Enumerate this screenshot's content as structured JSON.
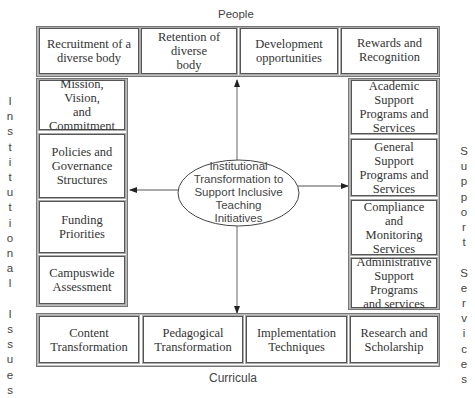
{
  "diagram": {
    "center": {
      "text": "Institutional\nTransformation to\nSupport Inclusive\nTeaching\nInitiatives"
    },
    "top_label": "People",
    "bottom_label": "Curricula",
    "left_label": "I\nn\ns\nt\ni\nt\nu\nt\ni\no\nn\na\nl\n\nI\ns\ns\nu\ne\ns",
    "right_label": "S\nu\np\np\no\nr\nt\n\nS\ne\nr\nv\ni\nc\ne\ns",
    "top_boxes": [
      {
        "text": "Recruitment of a\ndiverse body"
      },
      {
        "text": "Retention of diverse\nbody"
      },
      {
        "text": "Development\nopportunities"
      },
      {
        "text": "Rewards and\nRecognition"
      }
    ],
    "left_boxes": [
      {
        "text": "Mission, Vision,\nand Commitment"
      },
      {
        "text": "Policies and\nGovernance\nStructures"
      },
      {
        "text": "Funding\nPriorities"
      },
      {
        "text": "Campuswide\nAssessment"
      }
    ],
    "right_boxes": [
      {
        "text": "Academic Support\nPrograms and\nServices"
      },
      {
        "text": "General Support\nPrograms and\nServices"
      },
      {
        "text": "Compliance and\nMonitoring\nServices"
      },
      {
        "text": "Administrative\nSupport Programs\nand services"
      }
    ],
    "bottom_boxes": [
      {
        "text": "Content\nTransformation"
      },
      {
        "text": "Pedagogical\nTransformation"
      },
      {
        "text": "Implementation\nTechniques"
      },
      {
        "text": "Research and\nScholarship"
      }
    ],
    "colors": {
      "line": "#555555",
      "text": "#333333"
    }
  }
}
